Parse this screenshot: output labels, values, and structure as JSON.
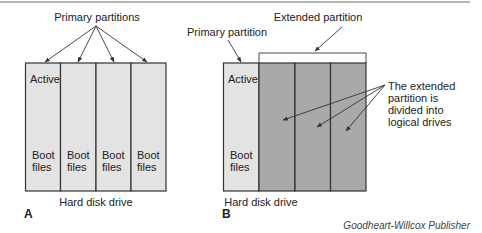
{
  "diagram": {
    "panel_a": {
      "letter": "A",
      "title": "Primary partitions",
      "drive_label": "Hard disk drive",
      "partitions": [
        {
          "top": "Active",
          "bottom": [
            "Boot",
            "files"
          ]
        },
        {
          "top": "",
          "bottom": [
            "Boot",
            "files"
          ]
        },
        {
          "top": "",
          "bottom": [
            "Boot",
            "files"
          ]
        },
        {
          "top": "",
          "bottom": [
            "Boot",
            "files"
          ]
        }
      ]
    },
    "panel_b": {
      "letter": "B",
      "primary_label": "Primary partition",
      "extended_label": "Extended partition",
      "logical_note": [
        "The extended",
        "partition is",
        "divided into",
        "logical drives"
      ],
      "drive_label": "Hard disk drive",
      "primary": {
        "top": "Active",
        "bottom": [
          "Boot",
          "files"
        ]
      },
      "logical_count": 3
    },
    "colors": {
      "primary_fill": "#e3e3e3",
      "logical_fill": "#a9a9a9",
      "stroke": "#333333",
      "top_rule": "#b5b5b5"
    },
    "credit": "Goodheart-Willcox Publisher"
  }
}
